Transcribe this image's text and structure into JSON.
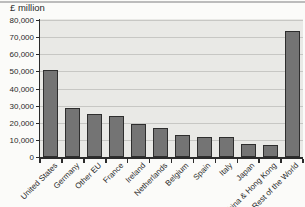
{
  "chart_data": {
    "type": "bar",
    "title": "£ million",
    "categories": [
      "United States",
      "Germany",
      "Other EU",
      "France",
      "Ireland",
      "Netherlands",
      "Belgium",
      "Spain",
      "Italy",
      "Japan",
      "China & Hong Kong",
      "Rest of the World"
    ],
    "values": [
      51000,
      28500,
      25000,
      24200,
      19000,
      17000,
      12800,
      11900,
      11400,
      7500,
      7200,
      73500
    ],
    "xlabel": "",
    "ylabel": "£ million",
    "ylim": [
      0,
      80000
    ],
    "ytick_step": 10000,
    "ytick_labels": [
      "0",
      "10,000",
      "20,000",
      "30,000",
      "40,000",
      "50,000",
      "60,000",
      "70,000",
      "80,000"
    ],
    "grid": "horizontal",
    "legend": "none",
    "colors": {
      "bar_fill": "#747474",
      "bar_border": "#2e2e2e",
      "plot_bg": "#e9e9e6",
      "gridline": "#c7c7c4",
      "axis": "#2b2b2b",
      "text": "#2a2a2a",
      "top_rule": "#bcbcbc"
    }
  }
}
